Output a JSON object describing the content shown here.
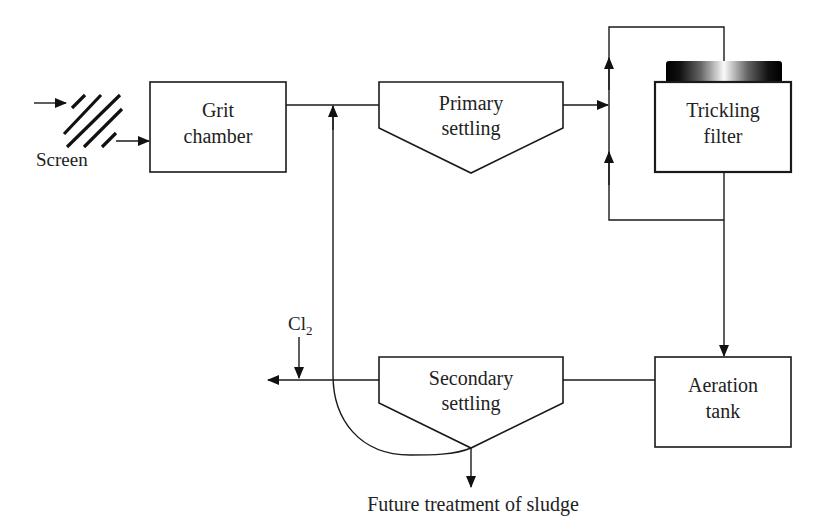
{
  "diagram": {
    "type": "process-flow",
    "nodes": {
      "screen": {
        "label": "Screen"
      },
      "grit_chamber": {
        "line1": "Grit",
        "line2": "chamber"
      },
      "primary_settling": {
        "line1": "Primary",
        "line2": "settling"
      },
      "trickling_filter": {
        "line1": "Trickling",
        "line2": "filter"
      },
      "aeration_tank": {
        "line1": "Aeration",
        "line2": "tank"
      },
      "secondary_settling": {
        "line1": "Secondary",
        "line2": "settling"
      }
    },
    "chlorine": {
      "symbol": "Cl",
      "subscript": "2"
    },
    "sludge_output": {
      "label": "Future treatment of sludge"
    },
    "edges": [
      {
        "from": "input",
        "to": "screen"
      },
      {
        "from": "screen",
        "to": "grit_chamber"
      },
      {
        "from": "grit_chamber",
        "to": "primary_settling"
      },
      {
        "from": "primary_settling",
        "to": "trickling_filter"
      },
      {
        "from": "trickling_filter",
        "to": "trickling_filter",
        "note": "recirculation loop"
      },
      {
        "from": "trickling_filter",
        "to": "aeration_tank"
      },
      {
        "from": "aeration_tank",
        "to": "secondary_settling"
      },
      {
        "from": "secondary_settling",
        "to": "effluent",
        "note": "Cl2 added"
      },
      {
        "from": "secondary_settling",
        "to": "primary_settling_inlet",
        "note": "sludge recycle"
      },
      {
        "from": "secondary_settling",
        "to": "sludge_output"
      }
    ]
  }
}
